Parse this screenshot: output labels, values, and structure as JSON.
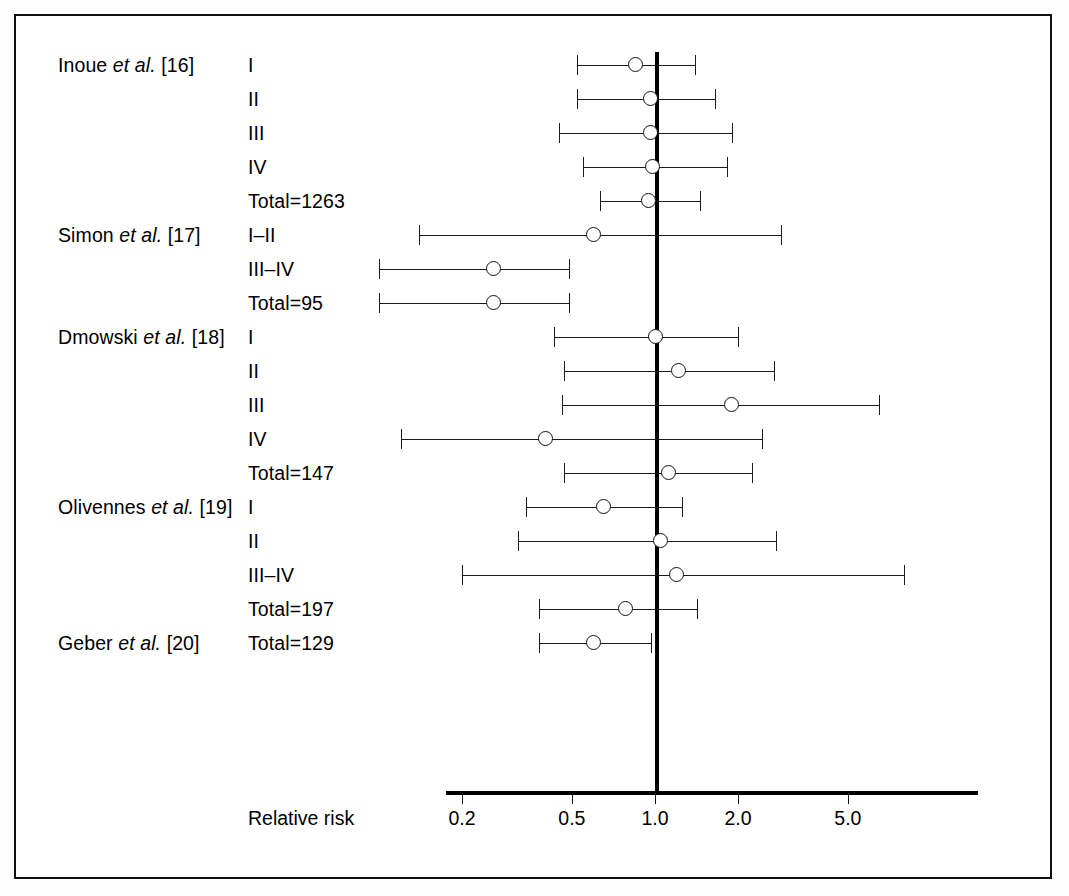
{
  "chart_data": {
    "type": "forest",
    "title": "",
    "xlabel": "Relative risk",
    "ylabel": "",
    "xscale": "log",
    "xticks": [
      0.2,
      0.5,
      1.0,
      2.0,
      5.0
    ],
    "xtick_labels": [
      "0.2",
      "0.5",
      "1.0",
      "2.0",
      "5.0"
    ],
    "xlim": [
      0.11,
      9.5
    ],
    "reference_line": 1.0,
    "grid": false,
    "legend": null,
    "marker_style": "open-circle",
    "rows": [
      {
        "study": "Inoue",
        "study_ref": "[16]",
        "study_label": "Inoue et al. [16]",
        "stage": "I",
        "rr": 0.85,
        "ci_low": 0.52,
        "ci_high": 1.4
      },
      {
        "study": "Inoue",
        "study_ref": "[16]",
        "study_label": "",
        "stage": "II",
        "rr": 0.96,
        "ci_low": 0.52,
        "ci_high": 1.65
      },
      {
        "study": "Inoue",
        "study_ref": "[16]",
        "study_label": "",
        "stage": "III",
        "rr": 0.96,
        "ci_low": 0.45,
        "ci_high": 1.9
      },
      {
        "study": "Inoue",
        "study_ref": "[16]",
        "study_label": "",
        "stage": "IV",
        "rr": 0.98,
        "ci_low": 0.55,
        "ci_high": 1.83
      },
      {
        "study": "Inoue",
        "study_ref": "[16]",
        "study_label": "",
        "stage": "Total=1263",
        "rr": 0.95,
        "ci_low": 0.63,
        "ci_high": 1.45
      },
      {
        "study": "Simon",
        "study_ref": "[17]",
        "study_label": "Simon et al. [17]",
        "stage": "I–II",
        "rr": 0.6,
        "ci_low": 0.14,
        "ci_high": 2.85
      },
      {
        "study": "Simon",
        "study_ref": "[17]",
        "study_label": "",
        "stage": "III–IV",
        "rr": 0.26,
        "ci_low": 0.1,
        "ci_high": 0.49
      },
      {
        "study": "Simon",
        "study_ref": "[17]",
        "study_label": "",
        "stage": "Total=95",
        "rr": 0.26,
        "ci_low": 0.1,
        "ci_high": 0.49
      },
      {
        "study": "Dmowski",
        "study_ref": "[18]",
        "study_label": "Dmowski et al. [18]",
        "stage": "I",
        "rr": 1.0,
        "ci_low": 0.43,
        "ci_high": 2.0
      },
      {
        "study": "Dmowski",
        "study_ref": "[18]",
        "study_label": "",
        "stage": "II",
        "rr": 1.22,
        "ci_low": 0.47,
        "ci_high": 2.7
      },
      {
        "study": "Dmowski",
        "study_ref": "[18]",
        "study_label": "",
        "stage": "III",
        "rr": 1.9,
        "ci_low": 0.46,
        "ci_high": 6.5
      },
      {
        "study": "Dmowski",
        "study_ref": "[18]",
        "study_label": "",
        "stage": "IV",
        "rr": 0.4,
        "ci_low": 0.12,
        "ci_high": 2.45
      },
      {
        "study": "Dmowski",
        "study_ref": "[18]",
        "study_label": "",
        "stage": "Total=147",
        "rr": 1.12,
        "ci_low": 0.47,
        "ci_high": 2.25
      },
      {
        "study": "Olivennes",
        "study_ref": "[19]",
        "study_label": "Olivennes et al. [19]",
        "stage": "I",
        "rr": 0.65,
        "ci_low": 0.34,
        "ci_high": 1.25
      },
      {
        "study": "Olivennes",
        "study_ref": "[19]",
        "study_label": "",
        "stage": "II",
        "rr": 1.05,
        "ci_low": 0.32,
        "ci_high": 2.75
      },
      {
        "study": "Olivennes",
        "study_ref": "[19]",
        "study_label": "",
        "stage": "III–IV",
        "rr": 1.2,
        "ci_low": 0.2,
        "ci_high": 8.0
      },
      {
        "study": "Olivennes",
        "study_ref": "[19]",
        "study_label": "",
        "stage": "Total=197",
        "rr": 0.78,
        "ci_low": 0.38,
        "ci_high": 1.42
      },
      {
        "study": "Geber",
        "study_ref": "[20]",
        "study_label": "Geber et al. [20]",
        "stage": "Total=129",
        "rr": 0.6,
        "ci_low": 0.38,
        "ci_high": 0.97
      }
    ]
  },
  "axis": {
    "title": "Relative risk",
    "tick_labels": [
      "0.2",
      "0.5",
      "1.0",
      "2.0",
      "5.0"
    ]
  },
  "studies": [
    {
      "prefix": "Inoue ",
      "italic": "et al.",
      "suffix": " [16]"
    },
    {
      "prefix": "Simon ",
      "italic": "et al.",
      "suffix": " [17]"
    },
    {
      "prefix": "Dmowski ",
      "italic": "et al.",
      "suffix": " [18]"
    },
    {
      "prefix": "Olivennes ",
      "italic": "et al.",
      "suffix": " [19]"
    },
    {
      "prefix": "Geber ",
      "italic": "et al.",
      "suffix": " [20]"
    }
  ],
  "colors": {
    "line": "#1a1a1a",
    "reference": "#000000",
    "marker_fill": "#ffffff",
    "frame": "#111111",
    "background": "#ffffff"
  }
}
